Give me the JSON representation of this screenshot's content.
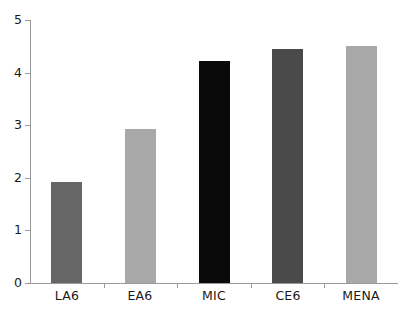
{
  "chart_data": {
    "type": "bar",
    "title": "",
    "xlabel": "",
    "ylabel": "",
    "categories": [
      "LA6",
      "EA6",
      "MIC",
      "CE6",
      "MENA"
    ],
    "values": [
      1.92,
      2.93,
      4.22,
      4.45,
      4.5
    ],
    "bar_colors": [
      "#666666",
      "#a8a8a8",
      "#0a0a0a",
      "#4a4a4a",
      "#a8a8a8"
    ],
    "ylim": [
      0,
      5
    ],
    "y_ticks": [
      0,
      1,
      2,
      3,
      4,
      5
    ],
    "y_tick_labels": [
      "0",
      "1",
      "2",
      "3",
      "4",
      "5"
    ],
    "grid": false,
    "legend": null,
    "axis_color": "#9a9a9a",
    "background": "#ffffff"
  }
}
